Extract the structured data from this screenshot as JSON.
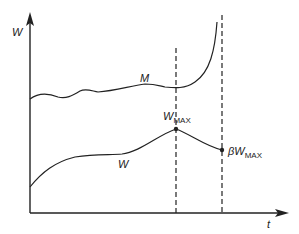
{
  "diagram": {
    "y_axis_label": "W",
    "x_axis_label": "t",
    "curve_upper_label": "M",
    "curve_lower_label": "W",
    "peak_label_main": "W",
    "peak_label_sub": "MAX",
    "end_label_prefix": "β",
    "end_label_main": "W",
    "end_label_sub": "MAX",
    "line_color": "#222222",
    "background": "#ffffff"
  }
}
